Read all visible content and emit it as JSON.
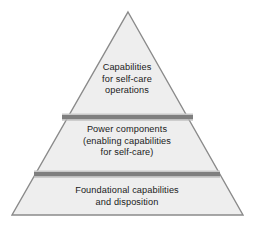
{
  "diagram": {
    "type": "pyramid",
    "title": "",
    "tiers": [
      {
        "id": "top",
        "label": "Capabilities\nfor self-care\noperations",
        "level": 3,
        "position": "apex"
      },
      {
        "id": "middle",
        "label": "Power components\n(enabling capabilities\nfor self-care)",
        "level": 2,
        "position": "middle"
      },
      {
        "id": "bottom",
        "label": "Foundational capabilities\nand disposition",
        "level": 1,
        "position": "base"
      }
    ],
    "colors": {
      "fill": "#eeeeee",
      "outline": "#888888",
      "divider": "#808080",
      "divider_highlight": "#c9c9c9",
      "text": "#1a1a1a",
      "background": "#ffffff"
    }
  }
}
